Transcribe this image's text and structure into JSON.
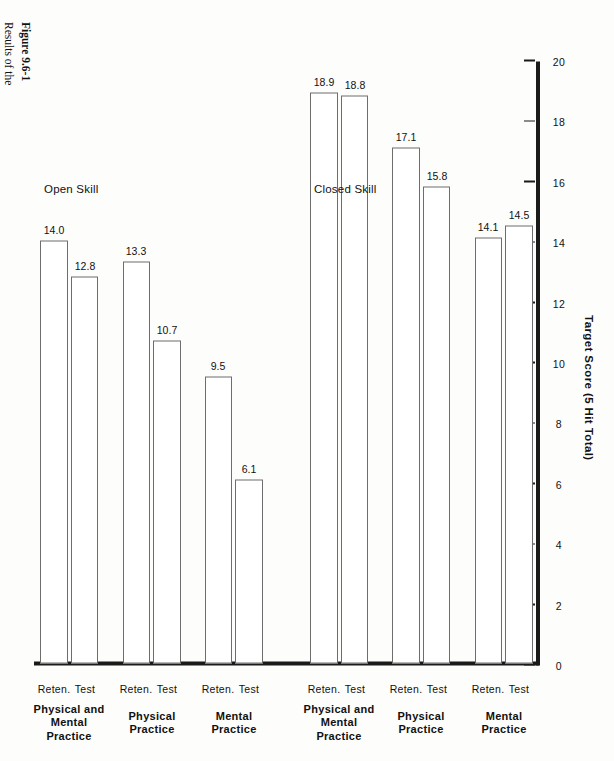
{
  "figure": {
    "label": "Figure 9.6-1",
    "caption": "Results of the\nexperiment by\nMcBride and\nRothstein showing\ntest and one-day\ntest retention\n(reten.)\nperformance\nfollowing 40 trials\nof mental practice,\nphysical practice,\nand a combination\nof physical and\nmental practice for\na closed and an\nopen motor skill."
  },
  "chart_data": {
    "type": "bar",
    "orientation": "rotated-90-ccw",
    "title": "",
    "xlabel": "",
    "ylabel": "Target Score (5 Hit Total)",
    "ylim": [
      0,
      20
    ],
    "yticks": [
      0,
      2,
      4,
      6,
      8,
      10,
      12,
      14,
      16,
      18,
      20
    ],
    "ytick_labels": [
      "0",
      "2",
      "4",
      "6",
      "8",
      "10",
      "12",
      "14",
      "16",
      "18",
      "20"
    ],
    "grid": false,
    "legend": "none",
    "panels": [
      {
        "name": "Closed Skill",
        "groups": [
          {
            "name": "Mental Practice",
            "name_lines": [
              "Mental",
              "Practice"
            ],
            "bars": [
              {
                "label": "Test",
                "value": 14.5,
                "value_label": "14.5"
              },
              {
                "label": "Reten.",
                "value": 14.1,
                "value_label": "14.1"
              }
            ]
          },
          {
            "name": "Physical Practice",
            "name_lines": [
              "Physical",
              "Practice"
            ],
            "bars": [
              {
                "label": "Test",
                "value": 15.8,
                "value_label": "15.8"
              },
              {
                "label": "Reten.",
                "value": 17.1,
                "value_label": "17.1"
              }
            ]
          },
          {
            "name": "Physical and Mental Practice",
            "name_lines": [
              "Physical and",
              "Mental",
              "Practice"
            ],
            "bars": [
              {
                "label": "Test",
                "value": 18.8,
                "value_label": "18.8"
              },
              {
                "label": "Reten.",
                "value": 18.9,
                "value_label": "18.9"
              }
            ]
          }
        ]
      },
      {
        "name": "Open Skill",
        "groups": [
          {
            "name": "Mental Practice",
            "name_lines": [
              "Mental",
              "Practice"
            ],
            "bars": [
              {
                "label": "Test",
                "value": 6.1,
                "value_label": "6.1"
              },
              {
                "label": "Reten.",
                "value": 9.5,
                "value_label": "9.5"
              }
            ]
          },
          {
            "name": "Physical Practice",
            "name_lines": [
              "Physical",
              "Practice"
            ],
            "bars": [
              {
                "label": "Test",
                "value": 10.7,
                "value_label": "10.7"
              },
              {
                "label": "Reten.",
                "value": 13.3,
                "value_label": "13.3"
              }
            ]
          },
          {
            "name": "Physical and Mental Practice",
            "name_lines": [
              "Physical and",
              "Mental",
              "Practice"
            ],
            "bars": [
              {
                "label": "Test",
                "value": 12.8,
                "value_label": "12.8"
              },
              {
                "label": "Reten.",
                "value": 14.0,
                "value_label": "14.0"
              }
            ]
          }
        ]
      }
    ]
  },
  "colors": {
    "axis": "#1a1a1a",
    "bar_fill": "#ffffff",
    "bar_stroke": "#6d6d6d",
    "text": "#111111",
    "page_background": "#fdfdfc"
  }
}
